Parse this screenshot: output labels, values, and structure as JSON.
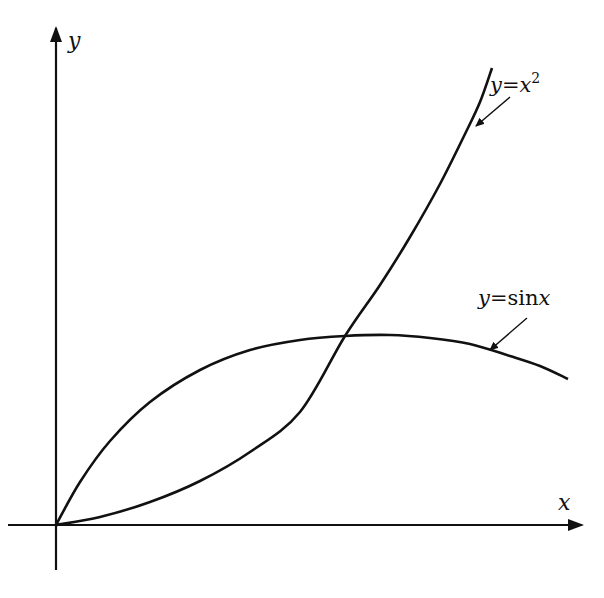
{
  "figure": {
    "width": 604,
    "height": 598,
    "origin_px": [
      56,
      525
    ],
    "axes": {
      "x_label": "x",
      "y_label": "y",
      "x_axis_px": {
        "from": [
          8,
          525
        ],
        "to": [
          582,
          525
        ]
      },
      "y_axis_px": {
        "from": [
          56,
          570
        ],
        "to": [
          56,
          28
        ]
      }
    },
    "curves": [
      {
        "name": "y=x^2",
        "label_parts": {
          "y": "y",
          "eq": "=",
          "base": "x",
          "exp": "2"
        },
        "label_pos": [
          490,
          92
        ],
        "arrow": {
          "from": [
            510,
            97
          ],
          "to": [
            476,
            126
          ]
        },
        "points_px": [
          [
            56,
            525
          ],
          [
            100,
            517
          ],
          [
            150,
            502
          ],
          [
            200,
            481
          ],
          [
            250,
            452
          ],
          [
            300,
            412
          ],
          [
            345,
            336
          ],
          [
            380,
            285
          ],
          [
            410,
            237
          ],
          [
            440,
            184
          ],
          [
            465,
            134
          ],
          [
            480,
            102
          ],
          [
            492,
            68
          ]
        ]
      },
      {
        "name": "y=sin x",
        "label_parts": {
          "y": "y",
          "eq": "=",
          "fn": "sin",
          "arg": "x"
        },
        "label_pos": [
          478,
          305
        ],
        "arrow": {
          "from": [
            527,
            318
          ],
          "to": [
            490,
            350
          ]
        },
        "points_px": [
          [
            56,
            525
          ],
          [
            80,
            482
          ],
          [
            110,
            441
          ],
          [
            150,
            402
          ],
          [
            200,
            370
          ],
          [
            250,
            350
          ],
          [
            300,
            340
          ],
          [
            345,
            336
          ],
          [
            390,
            335
          ],
          [
            430,
            338
          ],
          [
            470,
            344
          ],
          [
            510,
            356
          ],
          [
            540,
            366
          ],
          [
            568,
            379
          ]
        ]
      }
    ]
  },
  "chart_data": {
    "type": "line",
    "title": "",
    "xlabel": "x",
    "ylabel": "y",
    "grid": false,
    "legend": "inline labels with arrows",
    "series": [
      {
        "name": "y = x^2",
        "x": [
          0,
          0.2,
          0.4,
          0.6,
          0.8,
          0.8767,
          1.0,
          1.2,
          1.323
        ],
        "y": [
          0,
          0.04,
          0.16,
          0.36,
          0.64,
          0.7686,
          1.0,
          1.44,
          1.75
        ]
      },
      {
        "name": "y = sin x",
        "x": [
          0,
          0.2,
          0.4,
          0.6,
          0.8,
          0.8767,
          1.0,
          1.2,
          1.5
        ],
        "y": [
          0,
          0.199,
          0.389,
          0.565,
          0.717,
          0.7686,
          0.841,
          0.932,
          0.997
        ]
      }
    ],
    "annotations": [
      "y = x^2",
      "y = sin x"
    ],
    "note": "Schematic: curves intersect at origin and near x≈0.877"
  }
}
